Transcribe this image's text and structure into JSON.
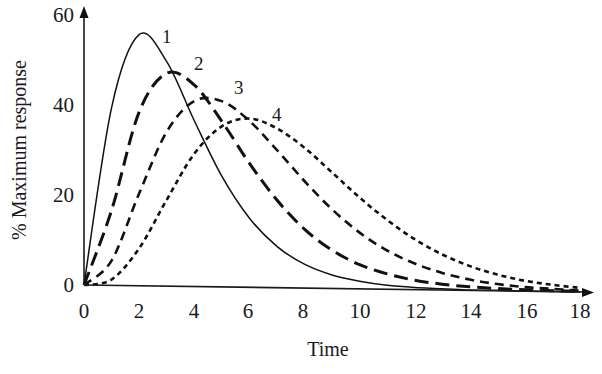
{
  "chart_data": {
    "type": "line",
    "title": "",
    "xlabel": "Time",
    "ylabel": "% Maximum response",
    "xlim": [
      0,
      18
    ],
    "ylim": [
      0,
      60
    ],
    "xticks": [
      0,
      2,
      4,
      6,
      8,
      10,
      12,
      14,
      16,
      18
    ],
    "yticks": [
      0,
      20,
      40,
      60
    ],
    "grid": false,
    "legend": "inline curve number labels near each peak",
    "x": [
      0,
      1,
      2,
      3,
      4,
      5,
      6,
      7,
      8,
      9,
      10,
      11,
      12,
      13,
      14,
      15,
      16,
      17,
      18
    ],
    "series": [
      {
        "name": "1",
        "line_style": "solid",
        "peak": {
          "x": 2.1,
          "y": 56
        },
        "values": [
          0,
          39.5,
          55.8,
          49.9,
          36.9,
          24.6,
          15.4,
          9.2,
          5.3,
          3.0,
          1.7,
          0.9,
          0.5,
          0.3,
          0.1,
          0.1,
          0,
          0,
          0
        ]
      },
      {
        "name": "2",
        "line_style": "long-dash",
        "peak": {
          "x": 3.2,
          "y": 47.5
        },
        "values": [
          0,
          16.7,
          38.6,
          47.3,
          44.8,
          36.8,
          27.6,
          19.5,
          13.1,
          8.5,
          5.4,
          3.4,
          2.1,
          1.3,
          0.8,
          0.5,
          0.3,
          0.2,
          0.1
        ]
      },
      {
        "name": "3",
        "line_style": "medium-dash",
        "peak": {
          "x": 4.5,
          "y": 42
        },
        "values": [
          0,
          5.5,
          20.5,
          34.3,
          41.2,
          41.3,
          37.0,
          30.6,
          23.8,
          17.6,
          12.5,
          8.6,
          5.8,
          3.8,
          2.4,
          1.5,
          0.9,
          0.6,
          0.3
        ]
      },
      {
        "name": "4",
        "line_style": "short-dash",
        "peak": {
          "x": 5.9,
          "y": 37.5
        },
        "values": [
          0,
          1.3,
          8.3,
          19.2,
          29.5,
          35.7,
          37.5,
          35.4,
          31.2,
          25.8,
          20.3,
          15.4,
          11.2,
          7.9,
          5.4,
          3.6,
          2.3,
          1.5,
          0.9
        ]
      }
    ],
    "curve_labels": [
      {
        "text": "1",
        "x": 2.8,
        "y": 56.5
      },
      {
        "text": "2",
        "x": 4.0,
        "y": 49
      },
      {
        "text": "3",
        "x": 5.5,
        "y": 43
      },
      {
        "text": "4",
        "x": 6.9,
        "y": 38.5
      }
    ]
  },
  "axes": {
    "x_title": "Time",
    "y_title": "% Maximum response",
    "x_tick_labels": [
      "0",
      "2",
      "4",
      "6",
      "8",
      "10",
      "12",
      "14",
      "16",
      "18"
    ],
    "y_tick_labels": [
      "0",
      "20",
      "40",
      "60"
    ]
  },
  "style": {
    "ink_color": "#111111",
    "background": "#ffffff"
  }
}
